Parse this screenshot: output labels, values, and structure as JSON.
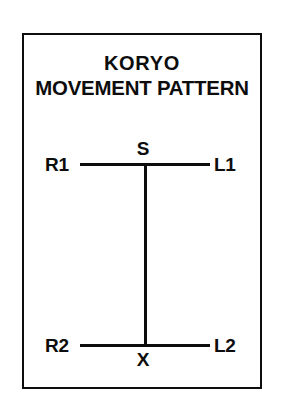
{
  "page": {
    "background_color": "#ffffff",
    "ink_color": "#0d0d0d"
  },
  "card": {
    "border_color": "#0d0d0d"
  },
  "title": {
    "line1": "KORYO",
    "line2": "MOVEMENT PATTERN"
  },
  "diagram": {
    "type": "movement-pattern-i-shape",
    "labels": {
      "top_left": "R1",
      "top_right": "L1",
      "top_center": "S",
      "bottom_left": "R2",
      "bottom_right": "L2",
      "bottom_center": "X"
    },
    "nodes": [
      {
        "id": "R1",
        "label": "R1",
        "position": "top-left-end"
      },
      {
        "id": "S",
        "label": "S",
        "position": "top-center-junction"
      },
      {
        "id": "L1",
        "label": "L1",
        "position": "top-right-end"
      },
      {
        "id": "R2",
        "label": "R2",
        "position": "bottom-left-end"
      },
      {
        "id": "X",
        "label": "X",
        "position": "bottom-center-junction"
      },
      {
        "id": "L2",
        "label": "L2",
        "position": "bottom-right-end"
      }
    ],
    "edges": [
      {
        "id": "top-rail",
        "from": "R1",
        "to": "L1",
        "orientation": "horizontal"
      },
      {
        "id": "bottom-rail",
        "from": "R2",
        "to": "L2",
        "orientation": "horizontal"
      },
      {
        "id": "center-stem",
        "from": "S",
        "to": "X",
        "orientation": "vertical"
      }
    ]
  }
}
